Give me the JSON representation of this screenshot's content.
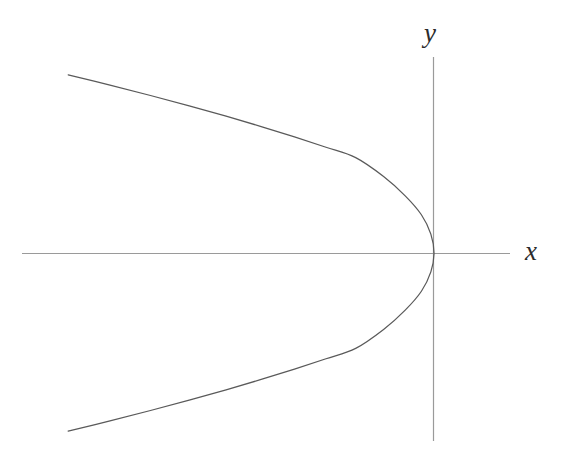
{
  "figure": {
    "background_color": "#ffffff",
    "width": 571,
    "height": 456,
    "axis_color": "#9a9a9a",
    "curve_color": "#5a5a5a",
    "label_color": "#2b2b2b"
  },
  "labels": {
    "x_axis": "x",
    "y_axis": "y"
  },
  "chart_data": {
    "type": "line",
    "title": "",
    "subtitle": "",
    "xlabel": "x",
    "ylabel": "y",
    "grid": false,
    "legend": null,
    "annotations": [],
    "equation": "x = -y^2",
    "orientation": "opens-left",
    "vertex": [
      0,
      0
    ],
    "xlim": [
      -9.2,
      1.6
    ],
    "ylim": [
      -4.2,
      4.2
    ],
    "x_axis_ticks": [],
    "y_axis_ticks": [],
    "x_axis_range_px": [
      22,
      510
    ],
    "y_axis_range_px": [
      57,
      441
    ],
    "origin_px": [
      434,
      253
    ],
    "px_per_unit": {
      "x": 45,
      "y": 45
    },
    "series": [
      {
        "name": "x = -y^2",
        "x": [
          -8.13,
          -7.2,
          -6.3,
          -5.44,
          -4.62,
          -3.84,
          -3.1,
          -2.4,
          -1.74,
          -1.12,
          -0.64,
          -0.28,
          -0.07,
          0.0,
          -0.07,
          -0.28,
          -0.64,
          -1.12,
          -1.74,
          -2.4,
          -3.1,
          -3.84,
          -4.62,
          -5.44,
          -6.3,
          -7.2,
          -8.13
        ],
        "y": [
          3.96,
          3.73,
          3.5,
          3.27,
          3.04,
          2.81,
          2.58,
          2.35,
          2.12,
          1.7,
          1.27,
          0.85,
          0.42,
          0.0,
          -0.42,
          -0.85,
          -1.27,
          -1.7,
          -2.12,
          -2.35,
          -2.58,
          -2.81,
          -3.04,
          -3.27,
          -3.5,
          -3.73,
          -3.96
        ]
      }
    ]
  }
}
